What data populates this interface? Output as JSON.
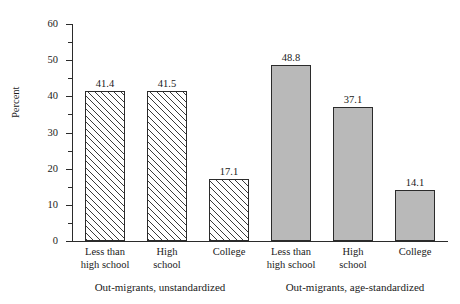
{
  "chart_data": {
    "type": "bar",
    "title": "",
    "xlabel": "",
    "ylabel": "Percent",
    "ylim": [
      0,
      60
    ],
    "y_major_step": 10,
    "y_minor_step": 5,
    "grid": false,
    "legend_position": "none",
    "categories": [
      "Less than high school",
      "High school",
      "College"
    ],
    "groups": [
      {
        "name": "Out-migrants, unstandardized",
        "fill": "hatched",
        "color": "#ffffff",
        "values": [
          41.4,
          41.5,
          17.1
        ],
        "value_labels": [
          "41.4",
          "41.5",
          "17.1"
        ]
      },
      {
        "name": "Out-migrants, age-standardized",
        "fill": "solid",
        "color": "#b9b9b9",
        "values": [
          48.8,
          37.1,
          14.1
        ],
        "value_labels": [
          "48.8",
          "37.1",
          "14.1"
        ]
      }
    ],
    "y_tick_labels": [
      "0",
      "10",
      "20",
      "30",
      "40",
      "50",
      "60"
    ],
    "y_tick_values": [
      0,
      10,
      20,
      30,
      40,
      50,
      60
    ]
  },
  "axis": {
    "y_title": "Percent",
    "ticks": [
      {
        "label": "60",
        "value": 60
      },
      {
        "label": "50",
        "value": 50
      },
      {
        "label": "40",
        "value": 40
      },
      {
        "label": "30",
        "value": 30
      },
      {
        "label": "20",
        "value": 20
      },
      {
        "label": "10",
        "value": 10
      },
      {
        "label": "0",
        "value": 0
      }
    ]
  },
  "category_labels": [
    {
      "line1": "Less than",
      "line2": "high school"
    },
    {
      "line1": "High",
      "line2": "school"
    },
    {
      "line1": "College",
      "line2": ""
    }
  ],
  "bars": [
    {
      "value_label": "41.4",
      "value": 41.4,
      "style": "hatched",
      "group": 0,
      "category": 0
    },
    {
      "value_label": "41.5",
      "value": 41.5,
      "style": "hatched",
      "group": 0,
      "category": 1
    },
    {
      "value_label": "17.1",
      "value": 17.1,
      "style": "hatched",
      "group": 0,
      "category": 2
    },
    {
      "value_label": "48.8",
      "value": 48.8,
      "style": "solid",
      "group": 1,
      "category": 0
    },
    {
      "value_label": "37.1",
      "value": 37.1,
      "style": "solid",
      "group": 1,
      "category": 1
    },
    {
      "value_label": "14.1",
      "value": 14.1,
      "style": "solid",
      "group": 1,
      "category": 2
    }
  ],
  "group_captions": [
    "Out-migrants, unstandardized",
    "Out-migrants, age-standardized"
  ],
  "colors": {
    "hatch_line": "#3a3a3a",
    "solid_fill": "#b9b9b9",
    "bar_border": "#2b2b2b",
    "axis": "#2b2b2b",
    "text": "#1a1a1a",
    "background": "#ffffff"
  }
}
